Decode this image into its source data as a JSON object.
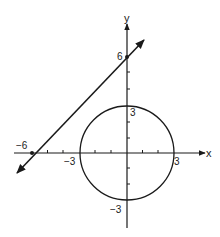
{
  "figure": {
    "type": "coordinate-plane",
    "axes": {
      "x_label": "x",
      "y_label": "y",
      "x_range": [
        -6.5,
        4.5
      ],
      "y_range": [
        -4.2,
        7.5
      ]
    },
    "tick_labels": {
      "x_neg6": "−6",
      "x_neg3": "−3",
      "x_pos3": "3",
      "y_pos6": "6",
      "y_pos3": "3",
      "y_neg3": "−3"
    },
    "circle": {
      "center": [
        0,
        0
      ],
      "radius": 3
    },
    "line": {
      "equation": "y = x + 6",
      "points": [
        [
          -6,
          0
        ],
        [
          0,
          6
        ]
      ]
    },
    "colors": {
      "stroke": "#1a1a1a",
      "background": "#ffffff"
    }
  }
}
